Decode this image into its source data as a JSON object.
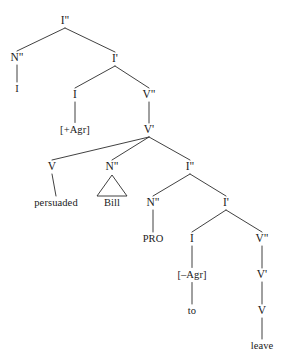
{
  "figure": {
    "kind": "syntax-tree",
    "line_color": "#2b2b2b",
    "text_color": "#1a1a1a",
    "background_color": "#ffffff",
    "width": 284,
    "height": 358
  },
  "nodes": [
    {
      "id": "IP_top",
      "label": "I\"",
      "x": 65,
      "y": 21,
      "kind": "cat"
    },
    {
      "id": "NP_subj",
      "label": "N\"",
      "x": 17,
      "y": 58,
      "kind": "cat"
    },
    {
      "id": "I_pronoun",
      "label": "I",
      "x": 17,
      "y": 89,
      "kind": "word"
    },
    {
      "id": "Ibar_top",
      "label": "I'",
      "x": 115,
      "y": 59,
      "kind": "cat"
    },
    {
      "id": "I_head_top",
      "label": "I",
      "x": 75,
      "y": 95,
      "kind": "cat"
    },
    {
      "id": "AgrPlus",
      "label": "[+Agr]",
      "x": 75,
      "y": 130,
      "kind": "feat"
    },
    {
      "id": "VP_top",
      "label": "V\"",
      "x": 149,
      "y": 95,
      "kind": "cat"
    },
    {
      "id": "Vbar_top",
      "label": "V'",
      "x": 149,
      "y": 130,
      "kind": "cat"
    },
    {
      "id": "V_head",
      "label": "V",
      "x": 52,
      "y": 167,
      "kind": "cat"
    },
    {
      "id": "persuaded",
      "label": "persuaded",
      "x": 56,
      "y": 203,
      "kind": "word"
    },
    {
      "id": "NP_bill",
      "label": "N\"",
      "x": 112,
      "y": 167,
      "kind": "cat"
    },
    {
      "id": "bill",
      "label": "Bill",
      "x": 112,
      "y": 203,
      "kind": "word"
    },
    {
      "id": "IP_embed",
      "label": "I\"",
      "x": 190,
      "y": 167,
      "kind": "cat"
    },
    {
      "id": "NP_pro",
      "label": "N\"",
      "x": 153,
      "y": 203,
      "kind": "cat"
    },
    {
      "id": "PRO",
      "label": "PRO",
      "x": 153,
      "y": 239,
      "kind": "word"
    },
    {
      "id": "Ibar_embed",
      "label": "I'",
      "x": 226,
      "y": 203,
      "kind": "cat"
    },
    {
      "id": "I_head_emb",
      "label": "I",
      "x": 192,
      "y": 239,
      "kind": "cat"
    },
    {
      "id": "AgrMinus",
      "label": "[–Agr]",
      "x": 192,
      "y": 275,
      "kind": "feat"
    },
    {
      "id": "to",
      "label": "to",
      "x": 192,
      "y": 311,
      "kind": "word"
    },
    {
      "id": "VP_embed",
      "label": "V\"",
      "x": 262,
      "y": 239,
      "kind": "cat"
    },
    {
      "id": "Vbar_embed",
      "label": "V'",
      "x": 262,
      "y": 275,
      "kind": "cat"
    },
    {
      "id": "V_embed",
      "label": "V",
      "x": 262,
      "y": 311,
      "kind": "cat"
    },
    {
      "id": "leave",
      "label": "leave",
      "x": 262,
      "y": 346,
      "kind": "word"
    }
  ],
  "edges": [
    {
      "from": "IP_top",
      "to": "NP_subj"
    },
    {
      "from": "IP_top",
      "to": "Ibar_top"
    },
    {
      "from": "NP_subj",
      "to": "I_pronoun"
    },
    {
      "from": "Ibar_top",
      "to": "I_head_top"
    },
    {
      "from": "Ibar_top",
      "to": "VP_top"
    },
    {
      "from": "I_head_top",
      "to": "AgrPlus"
    },
    {
      "from": "VP_top",
      "to": "Vbar_top"
    },
    {
      "from": "Vbar_top",
      "to": "V_head"
    },
    {
      "from": "Vbar_top",
      "to": "NP_bill"
    },
    {
      "from": "Vbar_top",
      "to": "IP_embed"
    },
    {
      "from": "V_head",
      "to": "persuaded"
    },
    {
      "from": "IP_embed",
      "to": "NP_pro"
    },
    {
      "from": "IP_embed",
      "to": "Ibar_embed"
    },
    {
      "from": "NP_pro",
      "to": "PRO"
    },
    {
      "from": "Ibar_embed",
      "to": "I_head_emb"
    },
    {
      "from": "Ibar_embed",
      "to": "VP_embed"
    },
    {
      "from": "I_head_emb",
      "to": "AgrMinus"
    },
    {
      "from": "AgrMinus",
      "to": "to"
    },
    {
      "from": "VP_embed",
      "to": "Vbar_embed"
    },
    {
      "from": "Vbar_embed",
      "to": "V_embed"
    },
    {
      "from": "V_embed",
      "to": "leave"
    }
  ],
  "triangles": [
    {
      "id": "tri_bill",
      "apex_x": 112,
      "apex_y": 175,
      "left_x": 97,
      "right_x": 127,
      "base_y": 196,
      "covers": "Bill"
    }
  ]
}
